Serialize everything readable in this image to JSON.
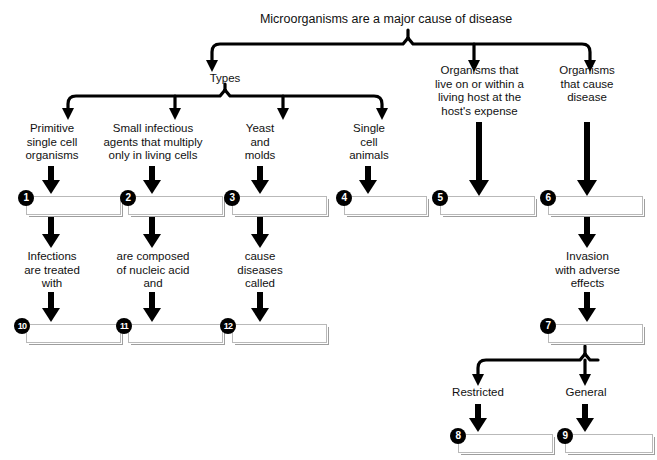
{
  "diagram": {
    "title": "Microorganisms are a major cause of disease",
    "branches": {
      "types": "Types",
      "host": "Organisms that\nlive on or within a\nliving host at the\nhost's expense",
      "disease": "Organisms\nthat cause\ndisease"
    },
    "type_descriptions": [
      "Primitive\nsingle cell\norganisms",
      "Small infectious\nagents that multiply\nonly in living cells",
      "Yeast\nand\nmolds",
      "Single\ncell\nanimals"
    ],
    "second_descriptions": [
      "Infections\nare treated\nwith",
      "are composed\nof nucleic acid\nand",
      "cause\ndiseases\ncalled",
      "Invasion\nwith adverse\neffects"
    ],
    "invasion_types": {
      "restricted": "Restricted",
      "general": "General"
    },
    "answer_boxes": [
      {
        "number": "1",
        "value": ""
      },
      {
        "number": "2",
        "value": ""
      },
      {
        "number": "3",
        "value": ""
      },
      {
        "number": "4",
        "value": ""
      },
      {
        "number": "5",
        "value": ""
      },
      {
        "number": "6",
        "value": ""
      },
      {
        "number": "7",
        "value": ""
      },
      {
        "number": "8",
        "value": ""
      },
      {
        "number": "9",
        "value": ""
      },
      {
        "number": "10",
        "value": ""
      },
      {
        "number": "11",
        "value": ""
      },
      {
        "number": "12",
        "value": ""
      }
    ],
    "colors": {
      "line": "#000000",
      "box_border": "#b9b9b9",
      "box_shadow": "#9e9e9e",
      "bullet_fill": "#000000",
      "bullet_text": "#ffffff",
      "background": "#ffffff"
    }
  }
}
